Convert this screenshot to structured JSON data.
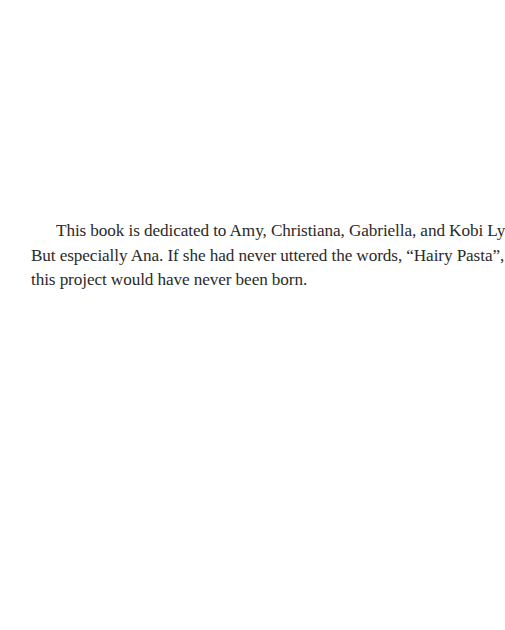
{
  "page": {
    "type": "dedication",
    "lines": [
      "This book is dedicated to Amy, Christiana, Gabriella, and Kobi Lyn.",
      "But especially Ana. If she had never uttered the words, “Hairy Pasta”,",
      "this project would have never been born."
    ],
    "colors": {
      "background": "#ffffff",
      "text": "#2a2a2a"
    }
  }
}
